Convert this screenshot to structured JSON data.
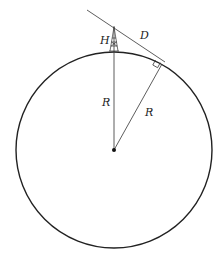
{
  "diagram": {
    "colors": {
      "stroke": "#222222",
      "background": "#ffffff"
    },
    "circle": {
      "cx": 114,
      "cy": 150,
      "r": 98
    },
    "center_point": {
      "x": 114,
      "y": 150
    },
    "tower": {
      "x": 114,
      "base_y": 52,
      "top_y": 26
    },
    "tangent_line": {
      "x1": 87,
      "y1": 10,
      "x2": 165,
      "y2": 62
    },
    "tangent_point": {
      "x": 162,
      "y": 64
    },
    "labels": {
      "height": "H",
      "distance": "D",
      "radius_vertical": "R",
      "radius_tangent": "R"
    },
    "right_angle_marker": true
  }
}
